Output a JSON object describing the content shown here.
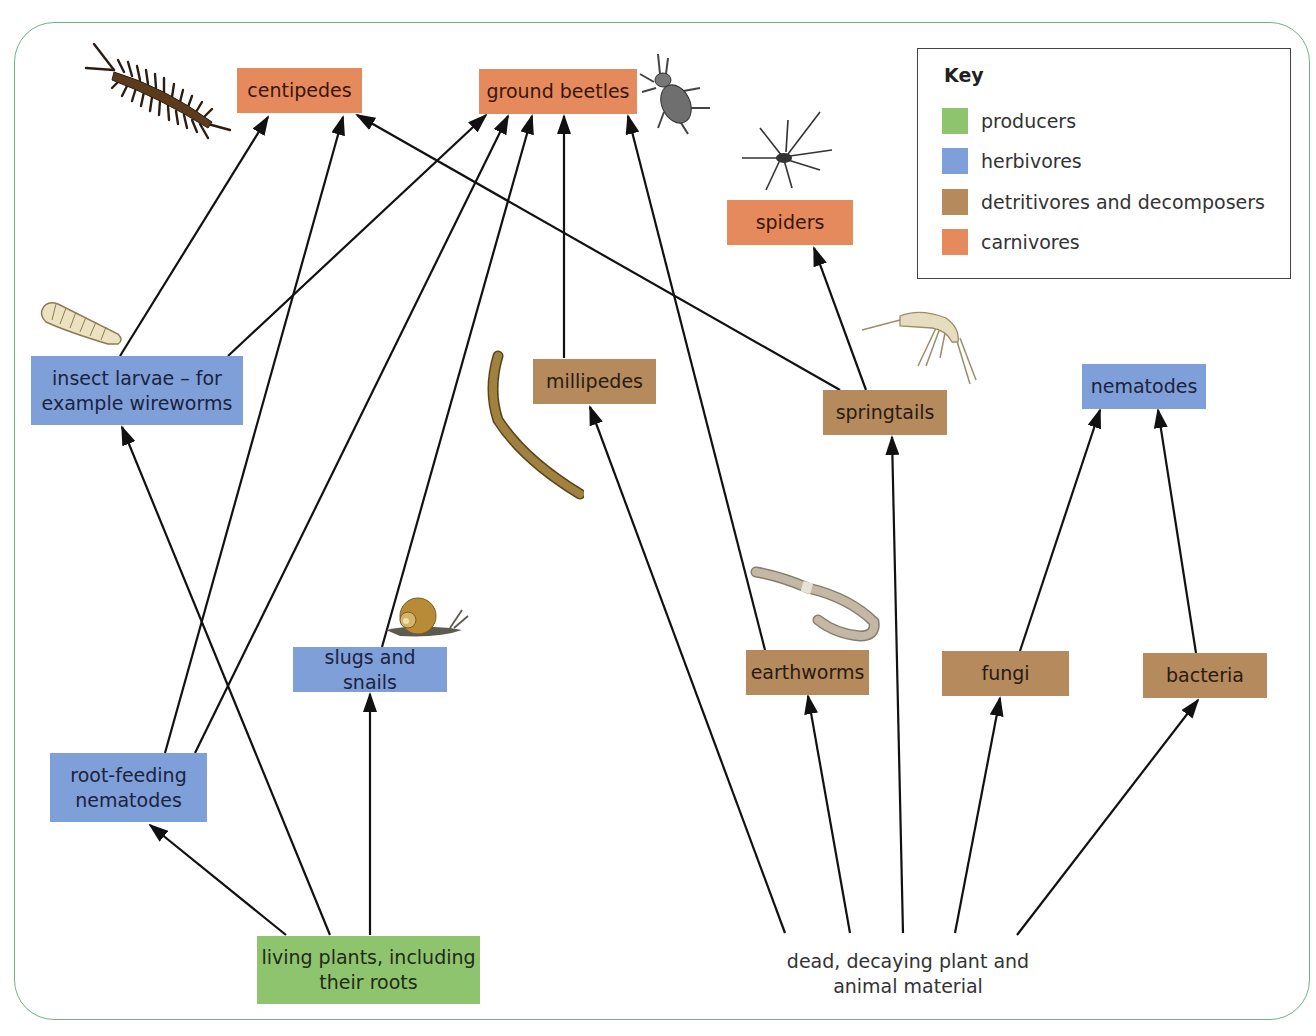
{
  "diagram": {
    "key": {
      "title": "Key",
      "items": [
        {
          "label": "producers",
          "color": "#8fc46e"
        },
        {
          "label": "herbivores",
          "color": "#7f9fd8"
        },
        {
          "label": "detritivores and decomposers",
          "color": "#b58a5c"
        },
        {
          "label": "carnivores",
          "color": "#e58a5c"
        }
      ]
    },
    "nodes": {
      "centipedes": {
        "label": "centipedes",
        "category": "carnivores"
      },
      "ground_beetles": {
        "label": "ground beetles",
        "category": "carnivores"
      },
      "spiders": {
        "label": "spiders",
        "category": "carnivores"
      },
      "insect_larvae": {
        "label": "insect larvae – for example wireworms",
        "line1": "insect larvae – for",
        "line2": "example wireworms",
        "category": "herbivores"
      },
      "millipedes": {
        "label": "millipedes",
        "category": "detritivores and decomposers"
      },
      "springtails": {
        "label": "springtails",
        "category": "detritivores and decomposers"
      },
      "nematodes": {
        "label": "nematodes",
        "category": "herbivores"
      },
      "slugs_snails": {
        "label": "slugs and snails",
        "category": "herbivores"
      },
      "earthworms": {
        "label": "earthworms",
        "category": "detritivores and decomposers"
      },
      "fungi": {
        "label": "fungi",
        "category": "detritivores and decomposers"
      },
      "bacteria": {
        "label": "bacteria",
        "category": "detritivores and decomposers"
      },
      "root_nematodes": {
        "label": "root-feeding nematodes",
        "line1": "root-feeding",
        "line2": "nematodes",
        "category": "herbivores"
      },
      "living_plants": {
        "label": "living plants, including their roots",
        "line1": "living plants, including",
        "line2": "their roots",
        "category": "producers"
      },
      "dead_material": {
        "label": "dead, decaying plant and animal material",
        "line1": "dead, decaying plant and",
        "line2": "animal material",
        "category": "none"
      }
    },
    "edges": [
      {
        "from": "insect_larvae",
        "to": "centipedes"
      },
      {
        "from": "root_nematodes",
        "to": "centipedes"
      },
      {
        "from": "springtails",
        "to": "centipedes"
      },
      {
        "from": "insect_larvae",
        "to": "ground_beetles"
      },
      {
        "from": "root_nematodes",
        "to": "ground_beetles"
      },
      {
        "from": "slugs_snails",
        "to": "ground_beetles"
      },
      {
        "from": "millipedes",
        "to": "ground_beetles"
      },
      {
        "from": "earthworms",
        "to": "ground_beetles"
      },
      {
        "from": "springtails",
        "to": "spiders"
      },
      {
        "from": "fungi",
        "to": "nematodes"
      },
      {
        "from": "bacteria",
        "to": "nematodes"
      },
      {
        "from": "living_plants",
        "to": "root_nematodes"
      },
      {
        "from": "living_plants",
        "to": "insect_larvae"
      },
      {
        "from": "living_plants",
        "to": "slugs_snails"
      },
      {
        "from": "dead_material",
        "to": "millipedes"
      },
      {
        "from": "dead_material",
        "to": "earthworms"
      },
      {
        "from": "dead_material",
        "to": "springtails"
      },
      {
        "from": "dead_material",
        "to": "fungi"
      },
      {
        "from": "dead_material",
        "to": "bacteria"
      }
    ],
    "illustrations": [
      "centipede-illustration",
      "ground-beetle-illustration",
      "spider-illustration",
      "larva-illustration",
      "millipede-illustration",
      "springtail-illustration",
      "snail-illustration",
      "earthworm-illustration"
    ]
  }
}
